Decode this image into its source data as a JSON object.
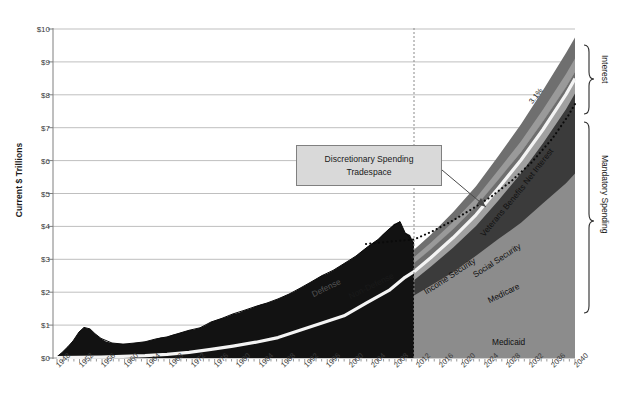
{
  "title": "",
  "axes": {
    "ylabel": "Current $ Trillions",
    "yticks": [
      "$0",
      "$1",
      "$2",
      "$3",
      "$4",
      "$5",
      "$6",
      "$7",
      "$8",
      "$9",
      "$10"
    ],
    "xticks": [
      "1948",
      "1952",
      "1956",
      "1960",
      "1964",
      "1968",
      "1972",
      "1976",
      "1980",
      "1984",
      "1988",
      "1992",
      "1996",
      "2000",
      "2004",
      "2008",
      "2012",
      "2016",
      "2020",
      "2024",
      "2028",
      "2032",
      "2036",
      "2040"
    ]
  },
  "annotations": {
    "callout_line1": "Discretionary Spending",
    "callout_line2": "Tradespace",
    "growth_rate": "3.1%",
    "bracket_interest": "Interest",
    "bracket_mandatory": "Mandatory Spending"
  },
  "series_labels": {
    "medicaid": "Medicaid",
    "medicare": "Medicare",
    "social_security": "Social Security",
    "income_security": "Income Security",
    "veterans": "Veterans Benefits",
    "net_interest": "Net Interest",
    "defense": "Defense",
    "non_defense": "Non-Defense"
  },
  "colors": {
    "medicaid": "#8c8c8c",
    "medicare": "#3b3b3b",
    "social_security": "#a0a0a0",
    "income_security": "#6e6e6e",
    "separator": "#f2f2f2",
    "veterans": "#9a9a9a",
    "net_interest": "#6f6f6f",
    "discretionary_nondefense": "#4a4a4a",
    "defense": "#121212",
    "gridline": "#bfbfbf",
    "axis": "#7f7f7f",
    "callout_fill": "#d9d9d9",
    "callout_border": "#808080"
  },
  "chart_data": {
    "type": "area",
    "title": "",
    "xlabel": "",
    "ylabel": "Current $ Trillions",
    "xlim": [
      1948,
      2040
    ],
    "ylim": [
      0,
      10
    ],
    "grid": true,
    "legend": "in-chart labels",
    "projection_start": 2013,
    "projected_growth_rate_pct": 3.1,
    "x": [
      1948,
      1952,
      1956,
      1960,
      1964,
      1968,
      1972,
      1976,
      1980,
      1984,
      1988,
      1992,
      1996,
      2000,
      2004,
      2008,
      2011,
      2013,
      2016,
      2020,
      2024,
      2028,
      2032,
      2036,
      2040
    ],
    "series": [
      {
        "name": "Medicaid",
        "values": [
          0.0,
          0.0,
          0.0,
          0.0,
          0.0,
          0.02,
          0.04,
          0.07,
          0.12,
          0.18,
          0.27,
          0.45,
          0.68,
          0.85,
          1.2,
          1.5,
          1.8,
          1.9,
          2.2,
          2.6,
          3.1,
          3.6,
          4.1,
          4.7,
          5.3
        ]
      },
      {
        "name": "Medicare",
        "values": [
          0.0,
          0.0,
          0.0,
          0.0,
          0.0,
          0.02,
          0.05,
          0.09,
          0.14,
          0.22,
          0.32,
          0.5,
          0.72,
          0.92,
          1.28,
          1.62,
          1.95,
          2.08,
          2.45,
          2.95,
          3.55,
          4.25,
          5.0,
          5.8,
          6.7
        ]
      },
      {
        "name": "Social Security",
        "values": [
          0.01,
          0.02,
          0.03,
          0.05,
          0.07,
          0.11,
          0.17,
          0.26,
          0.36,
          0.48,
          0.62,
          0.84,
          1.06,
          1.28,
          1.68,
          2.05,
          2.45,
          2.62,
          3.05,
          3.65,
          4.35,
          5.15,
          6.0,
          6.95,
          8.0
        ]
      },
      {
        "name": "Income Security",
        "values": [
          0.01,
          0.03,
          0.04,
          0.06,
          0.09,
          0.14,
          0.21,
          0.32,
          0.43,
          0.56,
          0.71,
          0.96,
          1.2,
          1.42,
          1.84,
          2.24,
          2.7,
          2.88,
          3.3,
          3.9,
          4.6,
          5.4,
          6.25,
          7.2,
          8.25
        ]
      },
      {
        "name": "Veterans Benefits",
        "values": [
          0.02,
          0.04,
          0.05,
          0.07,
          0.1,
          0.16,
          0.24,
          0.36,
          0.48,
          0.62,
          0.78,
          1.04,
          1.3,
          1.54,
          1.98,
          2.4,
          2.88,
          3.06,
          3.5,
          4.12,
          4.85,
          5.68,
          6.58,
          7.55,
          8.62
        ]
      },
      {
        "name": "Net Interest",
        "values": [
          0.02,
          0.05,
          0.06,
          0.08,
          0.12,
          0.18,
          0.27,
          0.4,
          0.53,
          0.68,
          0.86,
          1.14,
          1.42,
          1.68,
          2.14,
          2.58,
          3.08,
          3.28,
          3.74,
          4.4,
          5.18,
          6.06,
          7.02,
          8.05,
          9.15
        ]
      },
      {
        "name": "Non-Defense Discretionary",
        "values": [
          0.03,
          0.07,
          0.09,
          0.12,
          0.17,
          0.25,
          0.36,
          0.52,
          0.68,
          0.86,
          1.06,
          1.38,
          1.68,
          1.96,
          2.48,
          2.96,
          3.48,
          3.68,
          null,
          null,
          null,
          null,
          null,
          null,
          null
        ]
      },
      {
        "name": "Defense Discretionary",
        "values": [
          0.04,
          0.14,
          0.17,
          0.19,
          0.24,
          0.34,
          0.45,
          0.62,
          0.8,
          1.02,
          1.24,
          1.58,
          1.88,
          2.18,
          2.72,
          3.26,
          3.82,
          3.68,
          null,
          null,
          null,
          null,
          null,
          null,
          null
        ]
      }
    ],
    "notes": [
      "Dotted line above 2013 marks total spending growing at 3.1% annually",
      "Gap between dotted total line and mandatory+interest stack is the Discretionary Spending Tradespace"
    ]
  }
}
